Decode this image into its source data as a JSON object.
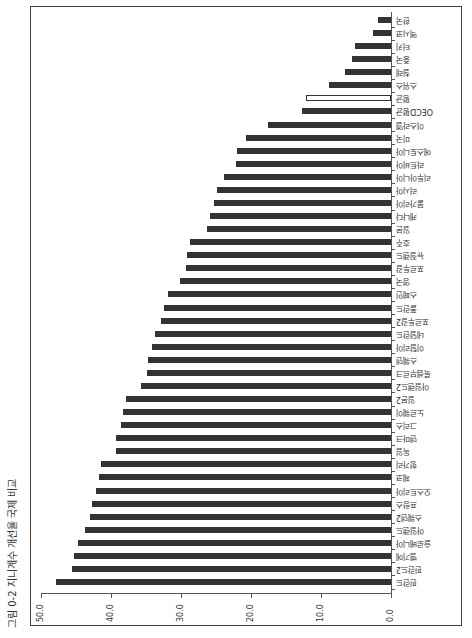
{
  "figure": {
    "title": "그림 0-2 지니계수 개선율 국제 비교"
  },
  "chart_data": {
    "type": "bar",
    "orientation": "horizontal (page rotated 90°)",
    "title": "그림 0-2 지니계수 개선율 국제 비교",
    "xlabel": "",
    "ylabel": "",
    "xlim": [
      0,
      50
    ],
    "ticks": [
      "0.0",
      "10.0",
      "20.0",
      "30.0",
      "40.0",
      "50.0"
    ],
    "grid": false,
    "legend": null,
    "categories": [
      "한국",
      "멕시코",
      "터키",
      "중국",
      "칠레",
      "스위스",
      "평균",
      "OECD평균",
      "이스라엘",
      "미국",
      "에스토니아",
      "라트비아",
      "리투아니아",
      "러시아",
      "불가리아",
      "캐나다",
      "일본",
      "호주",
      "뉴질랜드",
      "포르투갈",
      "영국",
      "스페인",
      "폴란드",
      "포르투갈2",
      "네덜란드",
      "이탈리아",
      "스웨덴",
      "룩셈부르크",
      "아일랜드2",
      "일본2",
      "노르웨이",
      "그리스",
      "덴마크",
      "독일",
      "헝가리",
      "체코",
      "오스트리아",
      "프랑스",
      "스웨덴2",
      "아일랜드",
      "슬로베니아",
      "벨기에",
      "핀란드2",
      "핀란드"
    ],
    "values": [
      1.9,
      2.6,
      5.1,
      5.6,
      6.6,
      8.9,
      12.1,
      12.7,
      17.6,
      20.7,
      22.0,
      22.1,
      23.9,
      24.9,
      25.3,
      25.9,
      26.3,
      28.7,
      29.1,
      29.3,
      30.1,
      31.9,
      32.4,
      32.9,
      33.7,
      34.1,
      34.7,
      34.9,
      35.7,
      37.9,
      38.3,
      38.6,
      39.3,
      39.3,
      41.4,
      41.7,
      42.1,
      42.7,
      43.0,
      43.7,
      44.7,
      45.3,
      45.6,
      47.9
    ],
    "highlight_index": 6,
    "colors": {
      "bar": "#333333",
      "highlight_bar": "#ffffff"
    }
  }
}
